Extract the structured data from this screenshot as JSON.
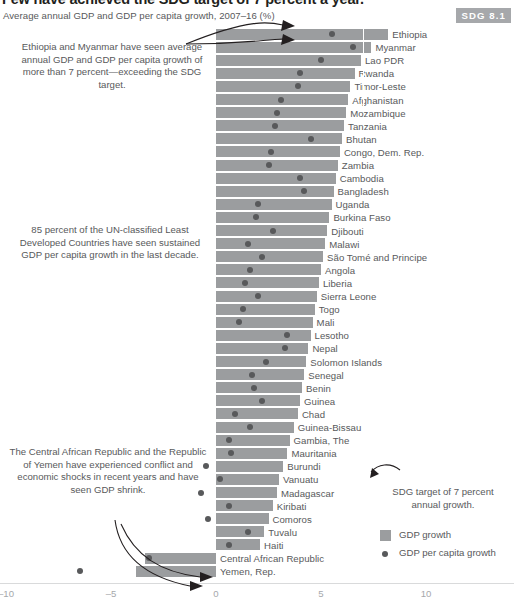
{
  "header": {
    "title": "Few have achieved the SDG target of 7 percent a year.",
    "subtitle": "Average annual GDP and GDP per capita growth, 2007–16 (%)",
    "badge": "SDG 8.1"
  },
  "annotations": {
    "a1": "Ethiopia and Myanmar have seen average annual GDP and GDP per capita growth of more than 7 percent—exceeding the SDG target.",
    "a2": "85 percent of the UN-classified Least Developed Countries have seen sustained GDP per capita growth in the last decade.",
    "a3": "The Central African Republic and the Republic of Yemen have experienced conflict and economic shocks in recent years and have seen GDP shrink.",
    "a4": "SDG target of 7 percent annual growth."
  },
  "legend": {
    "items": [
      {
        "label": "GDP growth",
        "marker": "square",
        "color": "#9b9d9f"
      },
      {
        "label": "GDP per capita growth",
        "marker": "dot",
        "color": "#58595b"
      }
    ]
  },
  "chart_data": {
    "type": "bar",
    "title": "Few have achieved the SDG target of 7 percent a year.",
    "subtitle": "Average annual GDP and GDP per capita growth, 2007–16 (%)",
    "xlabel": "",
    "ylabel": "",
    "xlim": [
      -10.3,
      11.5
    ],
    "xticks": [
      -10,
      -5,
      0,
      5,
      10
    ],
    "xticklabels": [
      "–10",
      "–5",
      "0",
      "5",
      "10"
    ],
    "grid": false,
    "orientation": "horizontal",
    "reference_line": {
      "value": 7,
      "label": "SDG target of 7 percent annual growth.",
      "color": "#ffffff",
      "style": "dashed"
    },
    "categories": [
      "Ethiopia",
      "Myanmar",
      "Lao PDR",
      "Rwanda",
      "Timor-Leste",
      "Afghanistan",
      "Mozambique",
      "Tanzania",
      "Bhutan",
      "Congo, Dem. Rep.",
      "Zambia",
      "Cambodia",
      "Bangladesh",
      "Uganda",
      "Burkina Faso",
      "Djibouti",
      "Malawi",
      "São Tomé and Principe",
      "Angola",
      "Liberia",
      "Sierra Leone",
      "Togo",
      "Mali",
      "Lesotho",
      "Nepal",
      "Solomon Islands",
      "Senegal",
      "Benin",
      "Guinea",
      "Chad",
      "Guinea-Bissau",
      "Gambia, The",
      "Mauritania",
      "Burundi",
      "Vanuatu",
      "Madagascar",
      "Kiribati",
      "Comoros",
      "Tuvalu",
      "Haiti",
      "Central African Republic",
      "Yemen, Rep."
    ],
    "series": [
      {
        "name": "GDP growth",
        "type": "bar",
        "color": "#9b9d9f",
        "values": [
          8.2,
          7.4,
          6.9,
          6.6,
          6.4,
          6.3,
          6.2,
          6.1,
          6.0,
          5.9,
          5.8,
          5.7,
          5.6,
          5.5,
          5.4,
          5.3,
          5.2,
          5.1,
          5.0,
          4.9,
          4.8,
          4.7,
          4.6,
          4.5,
          4.4,
          4.3,
          4.2,
          4.1,
          4.0,
          3.9,
          3.7,
          3.5,
          3.4,
          3.2,
          3.0,
          2.9,
          2.7,
          2.5,
          2.3,
          2.1,
          -3.4,
          -3.8
        ]
      },
      {
        "name": "GDP per capita growth",
        "type": "scatter",
        "color": "#58595b",
        "values": [
          5.5,
          6.5,
          5.0,
          4.0,
          3.9,
          3.1,
          2.9,
          2.8,
          4.5,
          2.6,
          2.5,
          4.0,
          4.2,
          2.0,
          1.9,
          2.7,
          1.5,
          2.2,
          1.6,
          1.4,
          2.0,
          1.3,
          1.1,
          3.4,
          3.3,
          2.4,
          1.7,
          1.8,
          2.2,
          0.9,
          1.6,
          0.6,
          0.7,
          -0.5,
          0.2,
          -0.7,
          0.6,
          -0.4,
          1.5,
          0.6,
          -3.2,
          -6.5
        ]
      }
    ]
  }
}
